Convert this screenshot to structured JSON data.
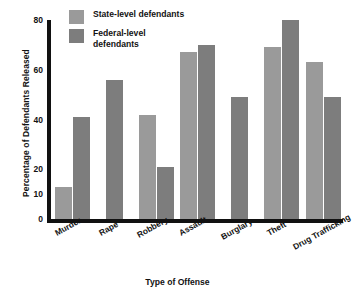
{
  "chart_data": {
    "type": "bar",
    "title": "",
    "xlabel": "Type of Offense",
    "ylabel": "Percentage of Defendants Released",
    "ylim": [
      0,
      80
    ],
    "yticks": [
      "0",
      "10",
      "20",
      "40",
      "60",
      "80"
    ],
    "grid": false,
    "legend_position": "top-left",
    "categories": [
      "Murder",
      "Rape",
      "Robbery",
      "Assault",
      "Burglary",
      "Theft",
      "Drug Trafficking"
    ],
    "series": [
      {
        "name": "State-level defendants",
        "color": "#9a9a9a",
        "values": [
          13,
          null,
          42,
          67,
          null,
          69,
          63
        ]
      },
      {
        "name": "Federal-level defendants",
        "color": "#7d7d7d",
        "values": [
          41,
          56,
          21,
          70,
          49,
          80,
          49
        ]
      }
    ]
  },
  "axis": {
    "y_title": "Percentage of Defendants Released",
    "x_title": "Type of Offense",
    "ticks": [
      {
        "label": "80",
        "value": 80
      },
      {
        "label": "60",
        "value": 60
      },
      {
        "label": "40",
        "value": 40
      },
      {
        "label": "20",
        "value": 20
      },
      {
        "label": "10",
        "value": 10
      },
      {
        "label": "0",
        "value": 0
      }
    ]
  },
  "legend": {
    "items": [
      {
        "label": "State-level defendants",
        "color": "#9a9a9a"
      },
      {
        "label": "Federal-level defendants",
        "color": "#7d7d7d"
      }
    ]
  },
  "categories": [
    {
      "label": "Murder"
    },
    {
      "label": "Rape"
    },
    {
      "label": "Robbery"
    },
    {
      "label": "Assault"
    },
    {
      "label": "Burglary"
    },
    {
      "label": "Theft"
    },
    {
      "label": "Drug Trafficking"
    }
  ]
}
